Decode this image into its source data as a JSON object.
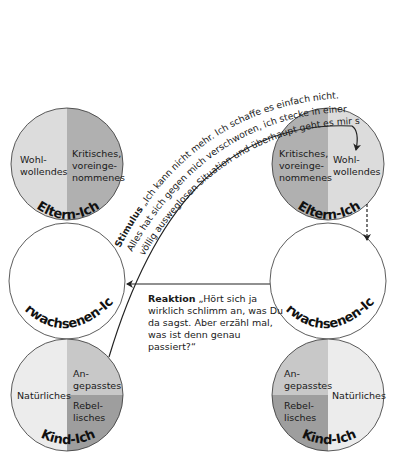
{
  "diagram": {
    "type": "transactional-analysis-ego-states",
    "colors": {
      "light_gray": "#dcdcdc",
      "mid_gray": "#b5b5b5",
      "dark_gray": "#9e9e9e",
      "white": "#ffffff",
      "stroke": "#222222"
    },
    "left_person": {
      "parent": {
        "title": "Eltern-Ich",
        "left_label": [
          "Wohl-",
          "wollendes"
        ],
        "right_label": [
          "Kritisches,",
          "voreinge-",
          "nommenes"
        ]
      },
      "adult": {
        "title": "Erwachsenen-Ich"
      },
      "child": {
        "title": "Kind-Ich",
        "left_label": "Natürliches",
        "top_right_label": [
          "An-",
          "gepasstes"
        ],
        "bottom_right_label": [
          "Rebel-",
          "lisches"
        ]
      }
    },
    "right_person": {
      "parent": {
        "title": "Eltern-Ich",
        "left_label": [
          "Kritisches,",
          "voreinge-",
          "nommenes"
        ],
        "right_label": [
          "Wohl-",
          "wollendes"
        ]
      },
      "adult": {
        "title": "Erwachsenen-Ich"
      },
      "child": {
        "title": "Kind-Ich",
        "top_left_label": [
          "An-",
          "gepasstes"
        ],
        "bottom_left_label": [
          "Rebel-",
          "lisches"
        ],
        "right_label": "Natürliches"
      }
    },
    "stimulus": {
      "keyword": "Stimulus",
      "line1": " „Ich kann nicht mehr. Ich schaffe es einfach nicht.",
      "line2": "Alles hat sich gegen mich verschworen, ich stecke in einer",
      "line3": "völlig ausweglosen Situation und überhaupt geht es mir so schlecht ... “"
    },
    "reaction": {
      "keyword": "Reaktion",
      "lines": [
        " „Hört sich ja",
        "wirklich schlimm an, was Du",
        "da sagst. Aber erzähl mal,",
        "was ist denn genau",
        "passiert?“"
      ]
    }
  }
}
